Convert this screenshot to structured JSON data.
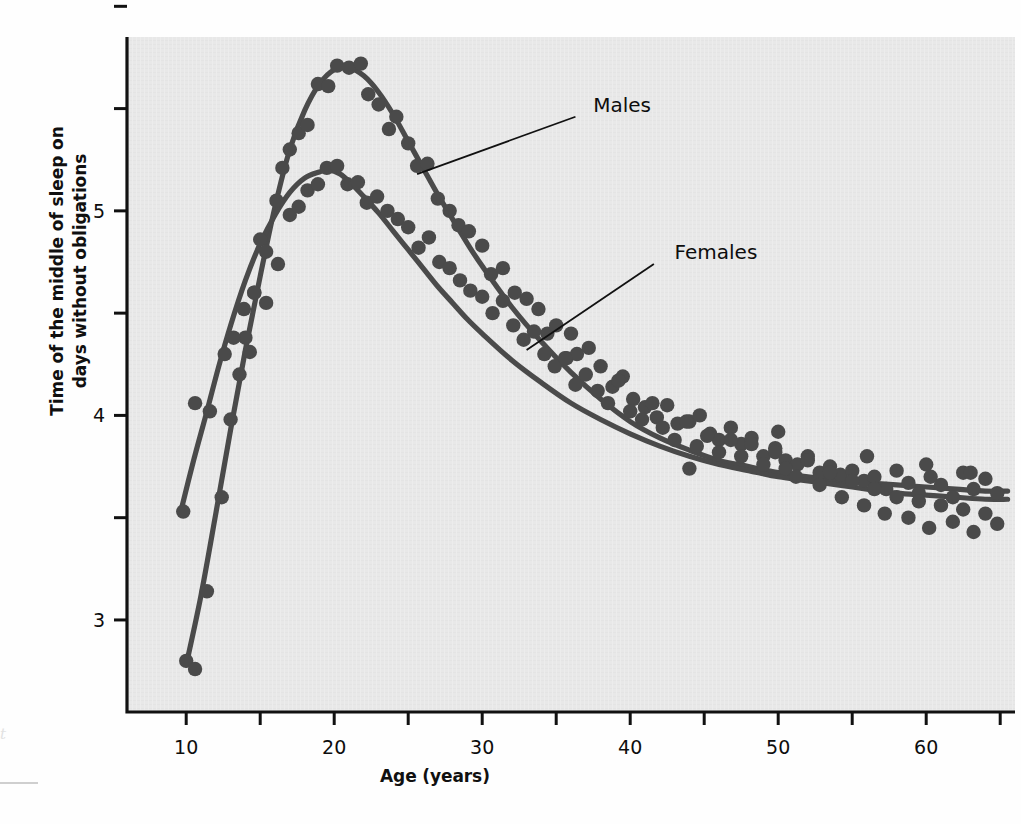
{
  "page": {
    "bleed_top_left": "",
    "bleed_top_right": "",
    "left_margin_mark": "t"
  },
  "chart_data": {
    "type": "scatter",
    "title": "",
    "xlabel": "Age (years)",
    "ylabel": "Time of the middle of sleep on days without obligations",
    "xlim": [
      6,
      66
    ],
    "ylim": [
      2.55,
      5.85
    ],
    "xticks_major": [
      10,
      20,
      30,
      40,
      50,
      60
    ],
    "xticks_minor": [
      15,
      25,
      35,
      45,
      55,
      65
    ],
    "xtick_labels": [
      "10",
      "20",
      "30",
      "40",
      "50",
      "60"
    ],
    "yticks_major": [
      3,
      4,
      5
    ],
    "ytick_labels": [
      "3",
      "4",
      "5"
    ],
    "yticks_minor": [
      3.5,
      4.5,
      5.5
    ],
    "grid": false,
    "legend_position": "inline-annotations",
    "colors": {
      "plot_background": "#e8e8e8",
      "axis": "#111111",
      "marker": "#4a4a4a",
      "curve": "#4a4a4a",
      "text": "#0d0d0d"
    },
    "series": [
      {
        "name": "Males",
        "label": "Males",
        "label_x": 37.5,
        "label_y": 5.52,
        "leader_from_x": 36.3,
        "leader_from_y": 5.46,
        "leader_to_x": 25.6,
        "leader_to_y": 5.18,
        "curve": [
          [
            10.0,
            2.78
          ],
          [
            11.0,
            3.12
          ],
          [
            12.0,
            3.52
          ],
          [
            13.0,
            3.93
          ],
          [
            14.0,
            4.32
          ],
          [
            15.0,
            4.68
          ],
          [
            16.0,
            5.02
          ],
          [
            17.0,
            5.3
          ],
          [
            18.0,
            5.49
          ],
          [
            19.0,
            5.62
          ],
          [
            20.0,
            5.69
          ],
          [
            21.0,
            5.7
          ],
          [
            22.0,
            5.66
          ],
          [
            23.0,
            5.58
          ],
          [
            24.0,
            5.47
          ],
          [
            25.0,
            5.34
          ],
          [
            26.0,
            5.21
          ],
          [
            27.0,
            5.08
          ],
          [
            28.0,
            4.96
          ],
          [
            29.0,
            4.84
          ],
          [
            30.0,
            4.73
          ],
          [
            32.0,
            4.53
          ],
          [
            34.0,
            4.36
          ],
          [
            36.0,
            4.21
          ],
          [
            38.0,
            4.08
          ],
          [
            40.0,
            3.97
          ],
          [
            42.0,
            3.89
          ],
          [
            44.0,
            3.83
          ],
          [
            46.0,
            3.78
          ],
          [
            48.0,
            3.75
          ],
          [
            50.0,
            3.72
          ],
          [
            52.0,
            3.7
          ],
          [
            54.0,
            3.68
          ],
          [
            56.0,
            3.67
          ],
          [
            58.0,
            3.66
          ],
          [
            60.0,
            3.65
          ],
          [
            62.0,
            3.64
          ],
          [
            64.0,
            3.63
          ],
          [
            65.5,
            3.63
          ]
        ],
        "points": [
          [
            10.0,
            2.8
          ],
          [
            10.6,
            2.76
          ],
          [
            11.4,
            3.14
          ],
          [
            12.4,
            3.6
          ],
          [
            13.0,
            3.98
          ],
          [
            13.6,
            4.2
          ],
          [
            14.0,
            4.38
          ],
          [
            14.3,
            4.31
          ],
          [
            14.6,
            4.6
          ],
          [
            15.0,
            4.86
          ],
          [
            15.4,
            4.55
          ],
          [
            16.1,
            5.05
          ],
          [
            16.5,
            5.21
          ],
          [
            17.0,
            5.3
          ],
          [
            17.6,
            5.38
          ],
          [
            18.2,
            5.42
          ],
          [
            18.9,
            5.62
          ],
          [
            19.6,
            5.61
          ],
          [
            20.2,
            5.71
          ],
          [
            21.0,
            5.7
          ],
          [
            21.8,
            5.72
          ],
          [
            22.3,
            5.57
          ],
          [
            23.0,
            5.52
          ],
          [
            23.7,
            5.4
          ],
          [
            24.2,
            5.46
          ],
          [
            25.0,
            5.33
          ],
          [
            25.6,
            5.22
          ],
          [
            26.3,
            5.23
          ],
          [
            27.0,
            5.06
          ],
          [
            27.8,
            5.0
          ],
          [
            28.4,
            4.93
          ],
          [
            29.1,
            4.9
          ],
          [
            30.0,
            4.83
          ],
          [
            30.6,
            4.69
          ],
          [
            31.4,
            4.72
          ],
          [
            32.2,
            4.6
          ],
          [
            33.0,
            4.57
          ],
          [
            33.8,
            4.52
          ],
          [
            34.4,
            4.4
          ],
          [
            35.0,
            4.44
          ],
          [
            35.7,
            4.28
          ],
          [
            36.4,
            4.3
          ],
          [
            37.2,
            4.33
          ],
          [
            38.0,
            4.24
          ],
          [
            38.8,
            4.14
          ],
          [
            39.5,
            4.19
          ],
          [
            40.2,
            4.08
          ],
          [
            41.0,
            4.04
          ],
          [
            41.8,
            3.99
          ],
          [
            42.5,
            4.05
          ],
          [
            43.2,
            3.96
          ],
          [
            44.0,
            3.97
          ],
          [
            44.7,
            4.0
          ],
          [
            45.4,
            3.91
          ],
          [
            46.0,
            3.88
          ],
          [
            46.8,
            3.94
          ],
          [
            47.5,
            3.86
          ],
          [
            48.2,
            3.89
          ],
          [
            49.0,
            3.8
          ],
          [
            49.8,
            3.84
          ],
          [
            50.5,
            3.78
          ],
          [
            51.3,
            3.76
          ],
          [
            52.0,
            3.8
          ],
          [
            52.8,
            3.72
          ],
          [
            53.5,
            3.75
          ],
          [
            54.2,
            3.71
          ],
          [
            55.0,
            3.73
          ],
          [
            55.8,
            3.68
          ],
          [
            56.5,
            3.7
          ],
          [
            57.3,
            3.64
          ],
          [
            58.0,
            3.73
          ],
          [
            58.8,
            3.67
          ],
          [
            59.5,
            3.62
          ],
          [
            60.3,
            3.7
          ],
          [
            61.0,
            3.66
          ],
          [
            61.8,
            3.6
          ],
          [
            62.5,
            3.72
          ],
          [
            63.2,
            3.64
          ],
          [
            64.0,
            3.69
          ],
          [
            64.8,
            3.62
          ]
        ]
      },
      {
        "name": "Females",
        "label": "Females",
        "label_x": 43.0,
        "label_y": 4.8,
        "leader_from_x": 41.6,
        "leader_from_y": 4.74,
        "leader_to_x": 33.0,
        "leader_to_y": 4.32,
        "curve": [
          [
            9.6,
            3.52
          ],
          [
            10.5,
            3.78
          ],
          [
            11.4,
            4.02
          ],
          [
            12.2,
            4.24
          ],
          [
            13.0,
            4.44
          ],
          [
            14.0,
            4.66
          ],
          [
            15.0,
            4.84
          ],
          [
            16.0,
            4.98
          ],
          [
            17.0,
            5.09
          ],
          [
            18.0,
            5.16
          ],
          [
            19.0,
            5.19
          ],
          [
            19.6,
            5.2
          ],
          [
            20.4,
            5.18
          ],
          [
            21.2,
            5.13
          ],
          [
            22.0,
            5.07
          ],
          [
            23.0,
            4.99
          ],
          [
            24.0,
            4.9
          ],
          [
            25.0,
            4.81
          ],
          [
            26.0,
            4.72
          ],
          [
            27.0,
            4.63
          ],
          [
            28.0,
            4.55
          ],
          [
            29.0,
            4.47
          ],
          [
            30.0,
            4.4
          ],
          [
            32.0,
            4.27
          ],
          [
            34.0,
            4.16
          ],
          [
            36.0,
            4.06
          ],
          [
            38.0,
            3.98
          ],
          [
            40.0,
            3.91
          ],
          [
            42.0,
            3.85
          ],
          [
            44.0,
            3.8
          ],
          [
            46.0,
            3.76
          ],
          [
            48.0,
            3.73
          ],
          [
            50.0,
            3.7
          ],
          [
            52.0,
            3.68
          ],
          [
            54.0,
            3.66
          ],
          [
            56.0,
            3.64
          ],
          [
            58.0,
            3.62
          ],
          [
            60.0,
            3.61
          ],
          [
            62.0,
            3.6
          ],
          [
            64.0,
            3.59
          ],
          [
            65.5,
            3.59
          ]
        ],
        "points": [
          [
            9.8,
            3.53
          ],
          [
            10.6,
            4.06
          ],
          [
            11.6,
            4.02
          ],
          [
            12.6,
            4.3
          ],
          [
            13.2,
            4.38
          ],
          [
            13.9,
            4.52
          ],
          [
            14.6,
            4.6
          ],
          [
            15.4,
            4.8
          ],
          [
            16.2,
            4.74
          ],
          [
            17.0,
            4.98
          ],
          [
            17.6,
            5.02
          ],
          [
            18.2,
            5.1
          ],
          [
            18.9,
            5.13
          ],
          [
            19.5,
            5.21
          ],
          [
            20.2,
            5.22
          ],
          [
            20.9,
            5.13
          ],
          [
            21.6,
            5.14
          ],
          [
            22.2,
            5.04
          ],
          [
            22.9,
            5.07
          ],
          [
            23.6,
            5.0
          ],
          [
            24.3,
            4.96
          ],
          [
            25.0,
            4.92
          ],
          [
            25.7,
            4.82
          ],
          [
            26.4,
            4.87
          ],
          [
            27.1,
            4.75
          ],
          [
            27.8,
            4.72
          ],
          [
            28.5,
            4.66
          ],
          [
            29.2,
            4.61
          ],
          [
            30.0,
            4.58
          ],
          [
            30.7,
            4.5
          ],
          [
            31.4,
            4.56
          ],
          [
            32.1,
            4.44
          ],
          [
            32.8,
            4.37
          ],
          [
            33.5,
            4.41
          ],
          [
            34.2,
            4.3
          ],
          [
            34.9,
            4.24
          ],
          [
            35.6,
            4.28
          ],
          [
            36.3,
            4.15
          ],
          [
            37.0,
            4.2
          ],
          [
            37.8,
            4.12
          ],
          [
            38.5,
            4.06
          ],
          [
            39.2,
            4.17
          ],
          [
            40.0,
            4.02
          ],
          [
            40.8,
            3.98
          ],
          [
            41.5,
            4.06
          ],
          [
            42.2,
            3.94
          ],
          [
            43.0,
            3.88
          ],
          [
            43.8,
            3.97
          ],
          [
            44.5,
            3.85
          ],
          [
            45.2,
            3.9
          ],
          [
            46.0,
            3.82
          ],
          [
            46.8,
            3.88
          ],
          [
            47.5,
            3.8
          ],
          [
            48.2,
            3.86
          ],
          [
            49.0,
            3.76
          ],
          [
            49.8,
            3.82
          ],
          [
            50.5,
            3.74
          ],
          [
            51.2,
            3.7
          ],
          [
            52.0,
            3.78
          ],
          [
            52.8,
            3.66
          ],
          [
            53.5,
            3.72
          ],
          [
            54.3,
            3.6
          ],
          [
            55.0,
            3.68
          ],
          [
            55.8,
            3.56
          ],
          [
            56.5,
            3.64
          ],
          [
            57.2,
            3.52
          ],
          [
            58.0,
            3.6
          ],
          [
            58.8,
            3.5
          ],
          [
            59.5,
            3.58
          ],
          [
            60.2,
            3.45
          ],
          [
            61.0,
            3.56
          ],
          [
            61.8,
            3.48
          ],
          [
            62.5,
            3.54
          ],
          [
            63.2,
            3.43
          ],
          [
            64.0,
            3.52
          ],
          [
            64.8,
            3.47
          ],
          [
            36.0,
            4.4
          ],
          [
            44.0,
            3.74
          ],
          [
            50.0,
            3.92
          ],
          [
            56.0,
            3.8
          ],
          [
            60.0,
            3.76
          ],
          [
            63.0,
            3.72
          ]
        ]
      }
    ]
  }
}
